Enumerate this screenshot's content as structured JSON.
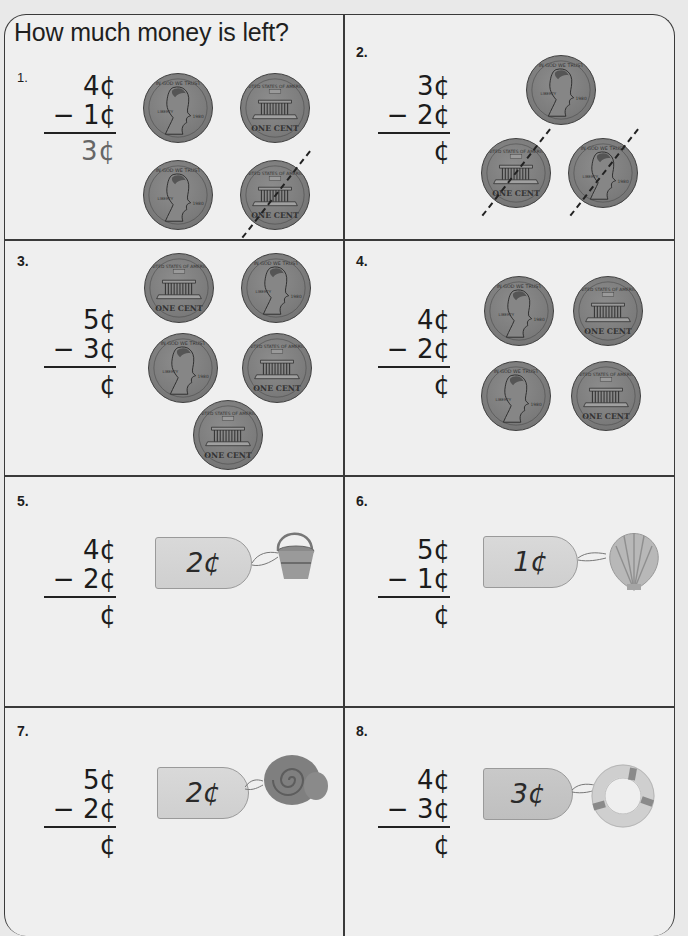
{
  "worksheet": {
    "title": "How much money is left?",
    "problems": [
      {
        "number": "1.",
        "minuend": "4¢",
        "subtrahend": "− 1¢",
        "answer": "3¢",
        "answer_hint": "dotted, pre-filled example",
        "visual": "coins",
        "coins": [
          "penny-heads",
          "penny-tails",
          "penny-heads",
          "penny-tails-crossed-out"
        ],
        "crossed_out": 1
      },
      {
        "number": "2.",
        "minuend": "3¢",
        "subtrahend": "− 2¢",
        "answer": "¢",
        "visual": "coins",
        "coins": [
          "penny-heads",
          "penny-tails-crossed-out",
          "penny-heads-crossed-out"
        ],
        "crossed_out": 2
      },
      {
        "number": "3.",
        "minuend": "5¢",
        "subtrahend": "− 3¢",
        "answer": "¢",
        "visual": "coins",
        "coins": [
          "penny-tails",
          "penny-heads",
          "penny-heads",
          "penny-tails",
          "penny-tails"
        ]
      },
      {
        "number": "4.",
        "minuend": "4¢",
        "subtrahend": "− 2¢",
        "answer": "¢",
        "visual": "coins",
        "coins": [
          "penny-heads",
          "penny-tails",
          "penny-heads",
          "penny-tails"
        ]
      },
      {
        "number": "5.",
        "minuend": "4¢",
        "subtrahend": "− 2¢",
        "answer": "¢",
        "visual": "price-tag",
        "price_tag": "2¢",
        "item": "sand bucket"
      },
      {
        "number": "6.",
        "minuend": "5¢",
        "subtrahend": "− 1¢",
        "answer": "¢",
        "visual": "price-tag",
        "price_tag": "1¢",
        "item": "scallop shell"
      },
      {
        "number": "7.",
        "minuend": "5¢",
        "subtrahend": "− 2¢",
        "answer": "¢",
        "visual": "price-tag",
        "price_tag": "2¢",
        "item": "snail shell"
      },
      {
        "number": "8.",
        "minuend": "4¢",
        "subtrahend": "− 3¢",
        "answer": "¢",
        "visual": "price-tag",
        "price_tag": "3¢",
        "item": "life ring"
      }
    ]
  },
  "colors": {
    "page": "#efefef",
    "border": "#3a3a3a",
    "coin": "#7d7d7d",
    "tag": "#d4d4d4",
    "text": "#1c1c1c"
  }
}
